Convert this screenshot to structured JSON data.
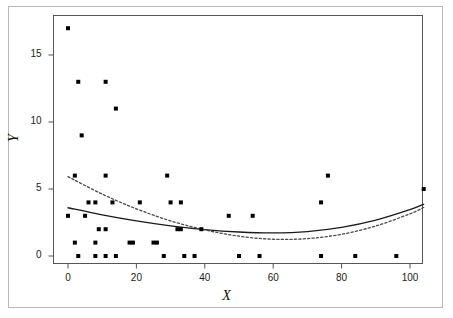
{
  "chart_data": {
    "type": "scatter",
    "title": "",
    "xlabel": "X",
    "ylabel": "Y",
    "xlim": [
      -5,
      107
    ],
    "ylim": [
      -0.7,
      18.0
    ],
    "grid": false,
    "legend": "none",
    "xticks": [
      0,
      20,
      40,
      60,
      80,
      100
    ],
    "xtick_labels": [
      "0",
      "20",
      "40",
      "60",
      "80",
      "100"
    ],
    "yticks": [
      0,
      5,
      10,
      15
    ],
    "ytick_labels": [
      "0",
      "5",
      "10",
      "15"
    ],
    "point_color": "#000000",
    "point_size": 2.0,
    "series": [
      {
        "name": "observations",
        "type": "scatter",
        "points": [
          [
            0,
            17
          ],
          [
            0,
            3
          ],
          [
            2,
            6
          ],
          [
            2,
            1
          ],
          [
            3,
            13
          ],
          [
            3,
            0
          ],
          [
            4,
            9
          ],
          [
            5,
            3
          ],
          [
            6,
            4
          ],
          [
            8,
            4
          ],
          [
            8,
            1
          ],
          [
            8,
            0
          ],
          [
            9,
            2
          ],
          [
            11,
            13
          ],
          [
            11,
            6
          ],
          [
            11,
            2
          ],
          [
            11,
            0
          ],
          [
            13,
            4
          ],
          [
            14,
            11
          ],
          [
            14,
            0
          ],
          [
            18,
            1
          ],
          [
            19,
            1
          ],
          [
            21,
            4
          ],
          [
            25,
            1
          ],
          [
            26,
            1
          ],
          [
            28,
            0
          ],
          [
            29,
            6
          ],
          [
            30,
            4
          ],
          [
            32,
            2
          ],
          [
            33,
            4
          ],
          [
            33,
            2
          ],
          [
            34,
            0
          ],
          [
            37,
            0
          ],
          [
            39,
            2
          ],
          [
            47,
            3
          ],
          [
            50,
            0
          ],
          [
            54,
            3
          ],
          [
            56,
            0
          ],
          [
            74,
            4
          ],
          [
            74,
            0
          ],
          [
            76,
            6
          ],
          [
            84,
            0
          ],
          [
            96,
            0
          ],
          [
            104,
            5
          ]
        ]
      },
      {
        "name": "fit-solid",
        "type": "line",
        "style": "solid",
        "color": "#1a1a1a",
        "points": [
          [
            0,
            3.6
          ],
          [
            10,
            3.07
          ],
          [
            20,
            2.62
          ],
          [
            30,
            2.25
          ],
          [
            40,
            1.97
          ],
          [
            50,
            1.79
          ],
          [
            60,
            1.72
          ],
          [
            70,
            1.82
          ],
          [
            80,
            2.13
          ],
          [
            90,
            2.67
          ],
          [
            100,
            3.46
          ],
          [
            104,
            3.86
          ]
        ]
      },
      {
        "name": "fit-dotted",
        "type": "line",
        "style": "dotted",
        "color": "#4a4a4a",
        "points": [
          [
            0,
            5.92
          ],
          [
            10,
            4.62
          ],
          [
            20,
            3.52
          ],
          [
            30,
            2.62
          ],
          [
            40,
            1.95
          ],
          [
            50,
            1.48
          ],
          [
            60,
            1.25
          ],
          [
            70,
            1.3
          ],
          [
            80,
            1.62
          ],
          [
            90,
            2.24
          ],
          [
            100,
            3.15
          ],
          [
            104,
            3.62
          ]
        ]
      }
    ]
  },
  "axes": {
    "x_title": "X",
    "y_title": "Y"
  }
}
